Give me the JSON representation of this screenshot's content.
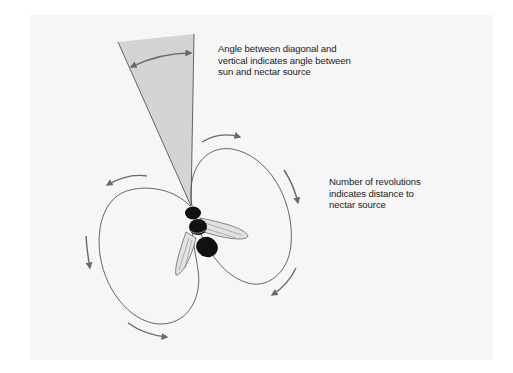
{
  "diagram": {
    "annotations": {
      "angle": {
        "lines": [
          "Angle between diagonal and",
          "vertical indicates angle between",
          "sun and nectar source"
        ]
      },
      "revolutions": {
        "lines": [
          "Number of revolutions",
          "indicates distance to",
          "nectar source"
        ]
      }
    },
    "elements": [
      {
        "name": "angle-wedge",
        "description": "grey wedge between vertical and diagonal"
      },
      {
        "name": "angle-arc-arrow",
        "description": "double-headed arc arrow indicating angle"
      },
      {
        "name": "right-loop",
        "description": "figure-eight right lobe with clockwise arrows"
      },
      {
        "name": "left-loop",
        "description": "figure-eight left lobe with counter-clockwise arrows"
      },
      {
        "name": "bee",
        "description": "bee at center of figure-eight"
      }
    ],
    "colors": {
      "panel": "#f6f6f6",
      "wedge": "#d4d4d4",
      "line": "#555555",
      "arrow": "#6a6a6a",
      "bee": "#111111"
    }
  }
}
